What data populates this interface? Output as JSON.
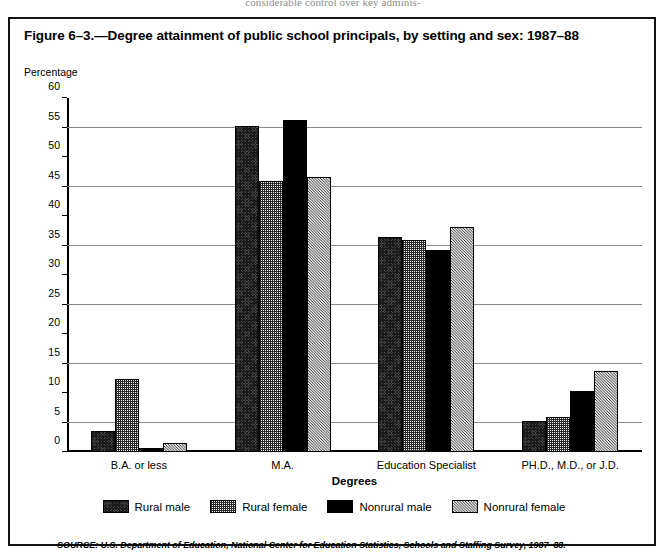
{
  "page_bleed_text": "considerable control over key adminis-",
  "figure": {
    "title": "Figure 6–3.—Degree attainment of public school principals, by setting and sex: 1987–88",
    "source_note": "SOURCE: U.S. Department of Education, National Center for Education Statistics, Schools and Staffing Survey, 1987–88."
  },
  "chart_data": {
    "type": "bar",
    "title": "Figure 6–3.—Degree attainment of public school principals, by setting and sex: 1987–88",
    "xlabel": "Degrees",
    "ylabel": "Percentage",
    "ylim": [
      0,
      60
    ],
    "yticks": [
      0,
      5,
      10,
      15,
      20,
      25,
      30,
      35,
      40,
      45,
      50,
      55,
      60
    ],
    "ytick_labels": [
      "0",
      "5",
      "10",
      "15",
      "20",
      "25",
      "30",
      "35",
      "40",
      "45",
      "50",
      "55",
      "60"
    ],
    "gridlines": [
      5,
      15,
      25,
      35,
      45,
      55
    ],
    "grid": true,
    "legend_position": "bottom",
    "categories": [
      "B.A. or less",
      "M.A.",
      "Education Specialist",
      "PH.D., M.D., or J.D."
    ],
    "series": [
      {
        "name": "Rural male",
        "values": [
          3.6,
          55.2,
          36.4,
          5.2
        ],
        "pattern": "dense-crosshatch-dark",
        "color": "#4a4a4a"
      },
      {
        "name": "Rural female",
        "values": [
          12.4,
          46.0,
          36.0,
          6.0
        ],
        "pattern": "checker-grey",
        "color": "#808080"
      },
      {
        "name": "Nonrural male",
        "values": [
          0.7,
          56.3,
          34.3,
          10.3
        ],
        "pattern": "solid-black",
        "color": "#000000"
      },
      {
        "name": "Nonrural female",
        "values": [
          1.5,
          46.6,
          38.2,
          13.8
        ],
        "pattern": "diagonal-hatch",
        "color": "#9a9a9a"
      }
    ]
  }
}
